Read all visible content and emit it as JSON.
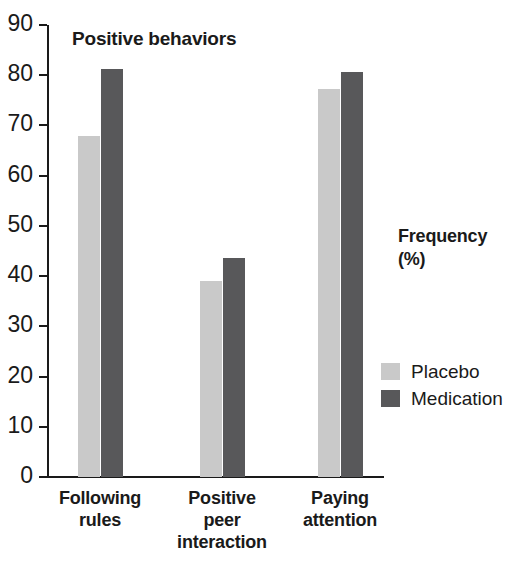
{
  "chart_data": {
    "type": "bar",
    "title": "Positive behaviors",
    "xlabel": "",
    "ylabel": "Frequency (%)",
    "ylabel_lines": [
      "Frequency",
      "(%)"
    ],
    "categories": [
      "Following rules",
      "Positive peer interaction",
      "Paying attention"
    ],
    "category_lines": [
      [
        "Following",
        "rules"
      ],
      [
        "Positive",
        "peer",
        "interaction"
      ],
      [
        "Paying",
        "attention"
      ]
    ],
    "series": [
      {
        "name": "Placebo",
        "color": "#c9c9c9",
        "values": [
          68,
          39,
          77.3
        ]
      },
      {
        "name": "Medication",
        "color": "#58585a",
        "values": [
          81.3,
          43.7,
          80.7
        ]
      }
    ],
    "ylim": [
      0,
      90
    ],
    "yticks": [
      90,
      80,
      70,
      60,
      50,
      40,
      30,
      20,
      10,
      0
    ],
    "ytick_labels": [
      "90",
      "80",
      "70",
      "60",
      "50",
      "40",
      "30",
      "20",
      "10",
      "0"
    ],
    "grid": false,
    "legend_position": "right"
  },
  "legend": {
    "title_lines": [
      "Frequency",
      "(%)"
    ],
    "entries": [
      {
        "label": "Placebo",
        "swatch": "placebo"
      },
      {
        "label": "Medication",
        "swatch": "medication"
      }
    ]
  }
}
